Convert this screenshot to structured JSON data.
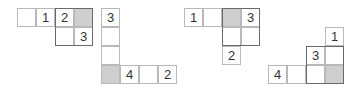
{
  "colors": {
    "shaded": "#cfcfcf",
    "border": "#b9b9b9",
    "block_border": "#6a6a6a"
  },
  "figures": [
    {
      "cells": [
        {
          "x": 17,
          "y": 8,
          "v": "",
          "shaded": false
        },
        {
          "x": 36,
          "y": 8,
          "v": "1",
          "shaded": false
        },
        {
          "x": 55,
          "y": 8,
          "v": "2",
          "shaded": false
        },
        {
          "x": 74,
          "y": 8,
          "v": "",
          "shaded": true
        },
        {
          "x": 55,
          "y": 27,
          "v": "",
          "shaded": false
        },
        {
          "x": 74,
          "y": 27,
          "v": "3",
          "shaded": false
        }
      ],
      "block": {
        "x": 55,
        "y": 8,
        "w": 38,
        "h": 38
      }
    },
    {
      "cells": [
        {
          "x": 101,
          "y": 8,
          "v": "3",
          "shaded": false
        },
        {
          "x": 101,
          "y": 27,
          "v": "",
          "shaded": false
        },
        {
          "x": 101,
          "y": 46,
          "v": "",
          "shaded": false
        },
        {
          "x": 101,
          "y": 65,
          "v": "",
          "shaded": true
        },
        {
          "x": 120,
          "y": 65,
          "v": "4",
          "shaded": false
        },
        {
          "x": 139,
          "y": 65,
          "v": "",
          "shaded": false
        },
        {
          "x": 158,
          "y": 65,
          "v": "2",
          "shaded": false
        }
      ],
      "block": null
    },
    {
      "cells": [
        {
          "x": 184,
          "y": 8,
          "v": "1",
          "shaded": false
        },
        {
          "x": 203,
          "y": 8,
          "v": "",
          "shaded": false
        },
        {
          "x": 222,
          "y": 8,
          "v": "",
          "shaded": true
        },
        {
          "x": 241,
          "y": 8,
          "v": "3",
          "shaded": false
        },
        {
          "x": 222,
          "y": 27,
          "v": "",
          "shaded": false
        },
        {
          "x": 241,
          "y": 27,
          "v": "",
          "shaded": false
        },
        {
          "x": 222,
          "y": 46,
          "v": "2",
          "shaded": false
        }
      ],
      "block": {
        "x": 222,
        "y": 8,
        "w": 38,
        "h": 38
      }
    },
    {
      "cells": [
        {
          "x": 325,
          "y": 27,
          "v": "1",
          "shaded": false
        },
        {
          "x": 306,
          "y": 46,
          "v": "3",
          "shaded": false
        },
        {
          "x": 325,
          "y": 46,
          "v": "",
          "shaded": false
        },
        {
          "x": 268,
          "y": 65,
          "v": "4",
          "shaded": false
        },
        {
          "x": 287,
          "y": 65,
          "v": "",
          "shaded": false
        },
        {
          "x": 306,
          "y": 65,
          "v": "",
          "shaded": false
        },
        {
          "x": 325,
          "y": 65,
          "v": "",
          "shaded": true
        }
      ],
      "block": {
        "x": 306,
        "y": 46,
        "w": 38,
        "h": 38
      }
    }
  ]
}
